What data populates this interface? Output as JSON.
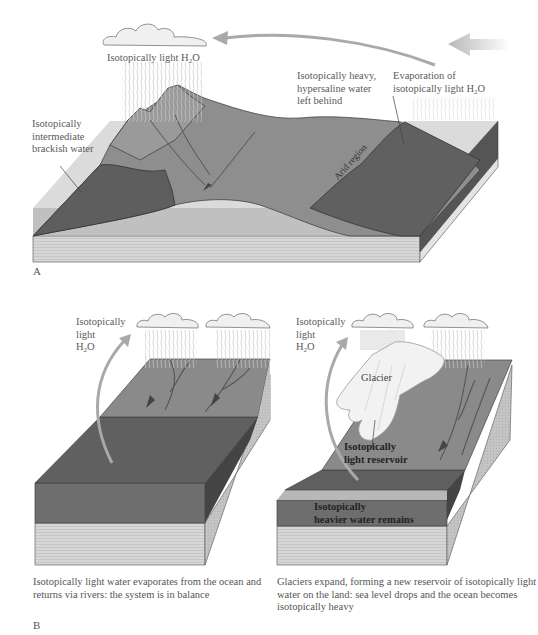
{
  "panelA": {
    "panel_label": "A",
    "labels": {
      "cloud_label_pre": "Isotopically light H",
      "cloud_label_sub": "2",
      "cloud_label_post": "O",
      "brackish": [
        "Isotopically",
        "intermediate",
        "brackish water"
      ],
      "hypersaline": [
        "Isotopically heavy,",
        "hypersaline water",
        "left behind"
      ],
      "evaporation_line1": "Evaporation of",
      "evaporation_line2_pre": "isotopically light H",
      "evaporation_line2_sub": "2",
      "evaporation_line2_post": "O",
      "arid": "Arid region"
    }
  },
  "panelB": {
    "panel_label": "B",
    "left": {
      "label_lines": [
        "Isotopically",
        "light"
      ],
      "h2o_pre": "H",
      "h2o_sub": "2",
      "h2o_post": "O",
      "caption": "Isotopically light water evaporates from the ocean and returns via rivers: the system is in balance"
    },
    "right": {
      "label_lines": [
        "Isotopically",
        "light"
      ],
      "h2o_pre": "H",
      "h2o_sub": "2",
      "h2o_post": "O",
      "glacier": "Glacier",
      "reservoir": [
        "Isotopically",
        "light reservoir"
      ],
      "heavier": [
        "Isotopically",
        "heavier water remains"
      ],
      "caption": "Glaciers expand, forming a new reservoir of isotopically light water on the land: sea level drops and the ocean becomes isotopically heavy"
    }
  },
  "colors": {
    "land": "#8c8c8c",
    "water_dark": "#5f5f5f",
    "water_face": "#6e6e6e",
    "sediment": "#d4d4d4",
    "arrow": "#a9a9a9",
    "glacier": "#f2f2f2"
  }
}
